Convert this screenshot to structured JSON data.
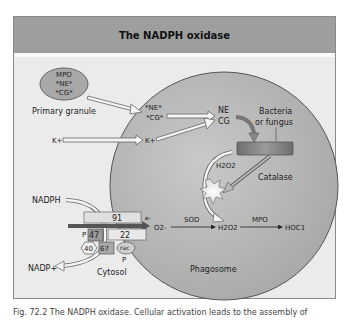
{
  "title": "The NADPH oxidase",
  "labels": {
    "granule_contents": [
      "MPO",
      "*NE*",
      "*CG*"
    ],
    "primary_granule": "Primary granule",
    "ne_cg_inside": [
      "*NE*",
      "*CG*"
    ],
    "ne": "NE",
    "cg": "CG",
    "k_outside": "K+",
    "k_inside": "K+",
    "bacteria": "Bacteria",
    "fungus": "or fungus",
    "h2o2_upper": "H2O2",
    "catalase": "Catalase",
    "nadph": "NADPH",
    "nadp": "NADP+",
    "subunit_91": "91",
    "subunit_22": "22",
    "subunit_47": "47",
    "subunit_67": "67",
    "subunit_40": "40",
    "rac": "rac",
    "p1": "P",
    "p2": "P",
    "electron": "e-",
    "o2": "O2-",
    "sod": "SOD",
    "h2o2_lower": "H2O2",
    "mpo": "MPO",
    "hocl": "HOC1",
    "cytosol": "Cytosol",
    "phagosome": "Phagosome"
  },
  "caption": "Fig. 72.2  The NADPH oxidase. Cellular activation leads to the assembly of",
  "colors": {
    "title_bg": "#9e9e9e",
    "panel_bg": "#ebebeb",
    "phagosome": "#b8b8b8",
    "granule": "#a8a8a8",
    "membrane_box": "#7a7a7a"
  }
}
